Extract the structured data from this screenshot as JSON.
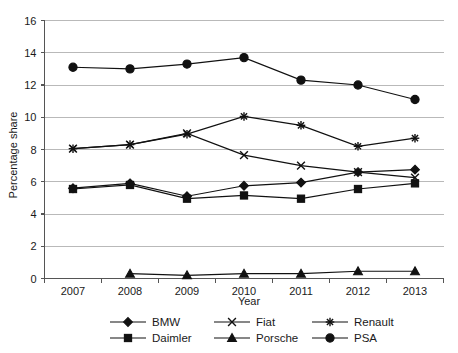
{
  "chart_data": {
    "type": "line",
    "title": "",
    "xlabel": "Year",
    "ylabel": "Percentage share",
    "x": [
      2007,
      2008,
      2009,
      2010,
      2011,
      2012,
      2013
    ],
    "xtick_labels": [
      "2007",
      "2008",
      "2009",
      "2010",
      "2011",
      "2012",
      "2013"
    ],
    "ytick_labels": [
      "0",
      "2",
      "4",
      "6",
      "8",
      "10",
      "12",
      "14",
      "16"
    ],
    "yticks": [
      0,
      2,
      4,
      6,
      8,
      10,
      12,
      14,
      16
    ],
    "ylim": [
      0,
      16
    ],
    "grid": "horizontal",
    "legend_position": "bottom",
    "series": [
      {
        "name": "BMW",
        "marker": "diamond",
        "values": [
          5.6,
          5.9,
          5.1,
          5.75,
          5.95,
          6.6,
          6.75
        ]
      },
      {
        "name": "Fiat",
        "marker": "cross-x",
        "values": [
          8.05,
          8.3,
          9.0,
          7.65,
          7.0,
          6.6,
          6.25
        ]
      },
      {
        "name": "Renault",
        "marker": "asterisk",
        "values": [
          8.05,
          8.3,
          8.95,
          10.05,
          9.5,
          8.2,
          8.7
        ]
      },
      {
        "name": "Daimler",
        "marker": "square",
        "values": [
          5.55,
          5.8,
          4.95,
          5.15,
          4.95,
          5.55,
          5.9
        ]
      },
      {
        "name": "Porsche",
        "marker": "triangle",
        "values": [
          null,
          0.3,
          0.2,
          0.3,
          0.3,
          0.45,
          0.45
        ]
      },
      {
        "name": "PSA",
        "marker": "circle",
        "values": [
          13.1,
          13.0,
          13.3,
          13.7,
          12.3,
          12.0,
          11.1
        ]
      }
    ]
  },
  "legend": {
    "entries": [
      {
        "label": "BMW",
        "marker": "diamond"
      },
      {
        "label": "Fiat",
        "marker": "cross-x"
      },
      {
        "label": "Renault",
        "marker": "asterisk"
      },
      {
        "label": "Daimler",
        "marker": "square"
      },
      {
        "label": "Porsche",
        "marker": "triangle"
      },
      {
        "label": "PSA",
        "marker": "circle"
      }
    ]
  },
  "colors": {
    "ink": "#111111",
    "grid": "#b9b9b9",
    "axis": "#555555",
    "background": "#ffffff"
  }
}
